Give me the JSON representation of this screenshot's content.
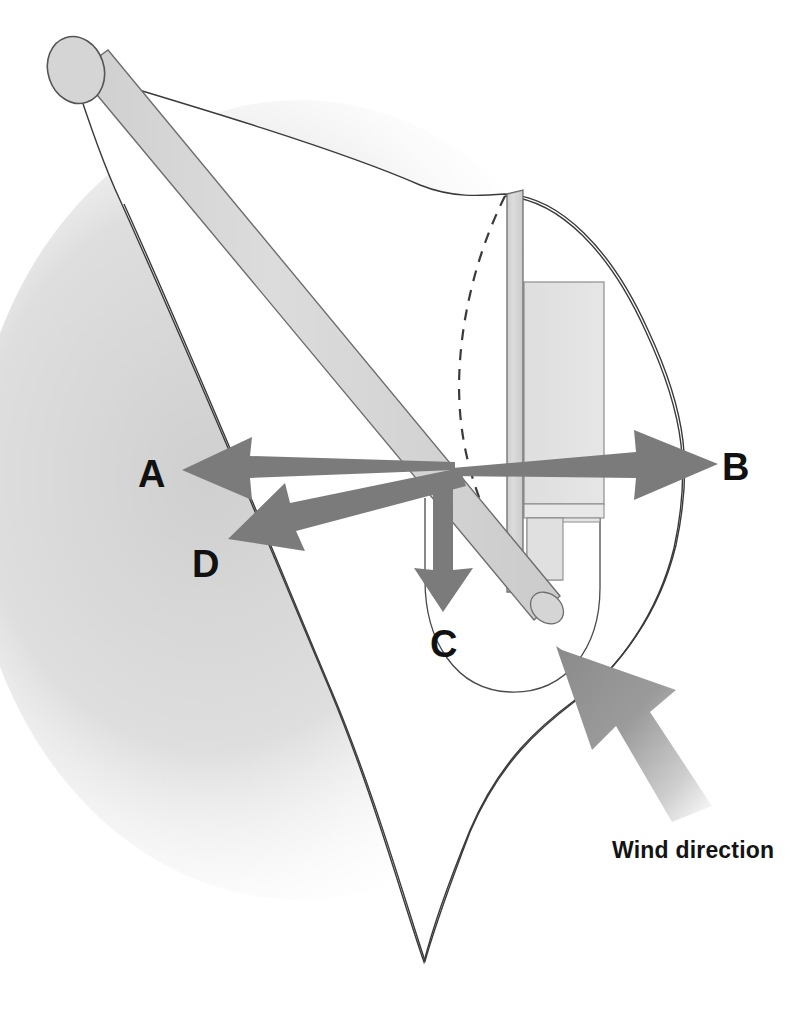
{
  "figure": {
    "background_color": "#ffffff",
    "shadow_color": "#d9d9d9"
  },
  "labels": {
    "a": "A",
    "b": "B",
    "c": "C",
    "d": "D",
    "wind": "Wind direction"
  },
  "colors": {
    "arrow_gray": "#7b7b7b",
    "wind_arrow_gray": "#8f8f8f",
    "outline": "#3a3a3a",
    "spar_fill": "#d7d7d7",
    "panel_fill": "#e2e2e2",
    "sail_fill": "#ffffff",
    "label_text": "#111111"
  },
  "elements": {
    "boom_end_cap": "rounded-boom-end",
    "boom": "boom-spar",
    "mast": "mast-spar",
    "sail": "sail-outline",
    "hull": "hull-outline",
    "cockpit": "cockpit-outline",
    "daggerboard_panel": "daggerboard-panel",
    "mast_step": "mast-step-box",
    "dashed_luff": "dashed-luff-line"
  },
  "arrows": [
    {
      "id": "A",
      "label": "A",
      "direction": "left",
      "note": "force arrow pointing left"
    },
    {
      "id": "B",
      "label": "B",
      "direction": "right",
      "note": "force arrow pointing right"
    },
    {
      "id": "C",
      "label": "C",
      "direction": "down",
      "note": "force arrow pointing down"
    },
    {
      "id": "D",
      "label": "D",
      "direction": "down-left",
      "note": "force arrow pointing lower-left"
    },
    {
      "id": "wind",
      "label": "Wind direction",
      "direction": "up-left",
      "note": "large gradient wind arrow"
    }
  ]
}
